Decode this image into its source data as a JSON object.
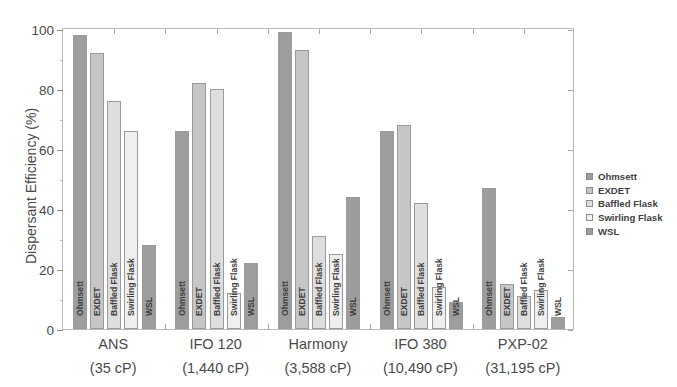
{
  "chart_data": {
    "type": "bar",
    "title": "",
    "xlabel": "",
    "ylabel": "Dispersant Efficiency (%)",
    "ylim": [
      0,
      100
    ],
    "yticks": [
      0,
      20,
      40,
      60,
      80,
      100
    ],
    "ytick_labels": [
      "0",
      "20",
      "40",
      "60",
      "80",
      "100"
    ],
    "grid": false,
    "legend_position": "right",
    "categories": [
      "ANS",
      "IFO 120",
      "Harmony",
      "IFO 380",
      "PXP-02"
    ],
    "category_sublabels": [
      "(35 cP)",
      "(1,440 cP)",
      "(3,588 cP)",
      "(10,490 cP)",
      "(31,195 cP)"
    ],
    "series": [
      {
        "name": "Ohmsett",
        "color": "#9d9d9d",
        "values": [
          98,
          66,
          99,
          66,
          47
        ]
      },
      {
        "name": "EXDET",
        "color": "#c6c6c6",
        "values": [
          92,
          82,
          93,
          68,
          15
        ]
      },
      {
        "name": "Baffled Flask",
        "color": "#dedede",
        "values": [
          76,
          80,
          31,
          42,
          11
        ]
      },
      {
        "name": "Swirling Flask",
        "color": "#efefef",
        "values": [
          66,
          12,
          25,
          14,
          13
        ]
      },
      {
        "name": "WSL",
        "color": "#9d9d9d",
        "values": [
          28,
          22,
          44,
          9,
          4
        ]
      }
    ],
    "bar_captions": [
      [
        "Ohmsett",
        "EXDET",
        "Baffled Flask",
        "Swirling Flask",
        "WSL"
      ],
      [
        "Ohmsett",
        "EXDET",
        "Baffled Flask",
        "Swirling Flask",
        "WSL"
      ],
      [
        "Ohmsett",
        "EXDET",
        "Baffled Flask",
        "Swirling Flask",
        "WSL"
      ],
      [
        "Ohmsett",
        "EXDET",
        "Baffled Flask",
        "Swirling Flask",
        "WSL"
      ],
      [
        "Ohmsett",
        "EXDET",
        "Baffled Flask",
        "Swirling Flask",
        "WSL"
      ]
    ]
  },
  "legend": {
    "items": [
      {
        "label": "Ohmsett",
        "color": "#9d9d9d"
      },
      {
        "label": "EXDET",
        "color": "#c6c6c6"
      },
      {
        "label": "Baffled Flask",
        "color": "#dedede"
      },
      {
        "label": "Swirling Flask",
        "color": "#efefef"
      },
      {
        "label": "WSL",
        "color": "#9d9d9d"
      }
    ]
  },
  "axis": {
    "y_title": "Dispersant Efficiency (%)"
  }
}
